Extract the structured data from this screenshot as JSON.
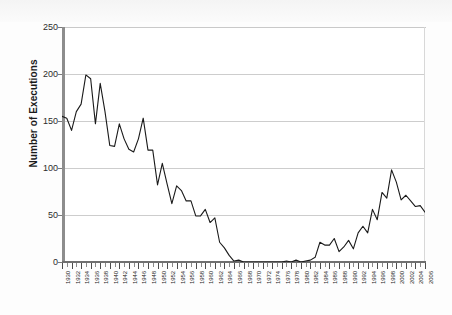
{
  "chart_data": {
    "type": "line",
    "title": "",
    "xlabel": "",
    "ylabel": "Number of Executions",
    "xlim": [
      1930,
      2006
    ],
    "ylim": [
      0,
      250
    ],
    "yticks": [
      0,
      50,
      100,
      150,
      200,
      250
    ],
    "xticks": [
      1930,
      1932,
      1934,
      1936,
      1938,
      1940,
      1942,
      1944,
      1946,
      1948,
      1950,
      1952,
      1954,
      1956,
      1958,
      1960,
      1962,
      1964,
      1966,
      1968,
      1970,
      1972,
      1974,
      1976,
      1978,
      1980,
      1982,
      1984,
      1986,
      1988,
      1990,
      1992,
      1994,
      1996,
      1998,
      2000,
      2002,
      2004,
      2006
    ],
    "grid": true,
    "legend": "none",
    "series": [
      {
        "name": "Executions",
        "color": "#1a1a1a",
        "x": [
          1930,
          1931,
          1932,
          1933,
          1934,
          1935,
          1936,
          1937,
          1938,
          1939,
          1940,
          1941,
          1942,
          1943,
          1944,
          1945,
          1946,
          1947,
          1948,
          1949,
          1950,
          1951,
          1952,
          1953,
          1954,
          1955,
          1956,
          1957,
          1958,
          1959,
          1960,
          1961,
          1962,
          1963,
          1964,
          1965,
          1966,
          1967,
          1968,
          1969,
          1970,
          1971,
          1972,
          1973,
          1974,
          1975,
          1976,
          1977,
          1978,
          1979,
          1980,
          1981,
          1982,
          1983,
          1984,
          1985,
          1986,
          1987,
          1988,
          1989,
          1990,
          1991,
          1992,
          1993,
          1994,
          1995,
          1996,
          1997,
          1998,
          1999,
          2000,
          2001,
          2002,
          2003,
          2004,
          2005,
          2006
        ],
        "values": [
          155,
          153,
          140,
          160,
          168,
          199,
          195,
          147,
          190,
          160,
          124,
          123,
          147,
          131,
          120,
          117,
          131,
          153,
          119,
          119,
          82,
          105,
          83,
          62,
          81,
          76,
          65,
          65,
          49,
          49,
          56,
          42,
          47,
          21,
          15,
          7,
          1,
          2,
          0,
          0,
          0,
          0,
          0,
          0,
          0,
          0,
          0,
          1,
          0,
          2,
          0,
          1,
          2,
          5,
          21,
          18,
          18,
          25,
          11,
          16,
          23,
          14,
          31,
          38,
          31,
          56,
          45,
          74,
          68,
          98,
          85,
          66,
          71,
          65,
          59,
          60,
          53
        ]
      }
    ]
  },
  "axis": {
    "y_title": "Number of Executions",
    "y_tick_labels": [
      "0",
      "50",
      "100",
      "150",
      "200",
      "250"
    ],
    "x_tick_labels": [
      "1930",
      "1932",
      "1934",
      "1936",
      "1938",
      "1940",
      "1942",
      "1944",
      "1946",
      "1948",
      "1950",
      "1952",
      "1954",
      "1956",
      "1958",
      "1960",
      "1962",
      "1964",
      "1966",
      "1968",
      "1970",
      "1972",
      "1974",
      "1976",
      "1978",
      "1980",
      "1982",
      "1984",
      "1986",
      "1988",
      "1990",
      "1992",
      "1994",
      "1996",
      "1998",
      "2000",
      "2002",
      "2004",
      "2006"
    ]
  },
  "colors": {
    "line": "#1a1a1a",
    "grid": "#cdcdcd",
    "axis": "#6f6f6f",
    "text": "#1a1a1a",
    "plot_background": "#ffffff",
    "page_background": "#fdfdfd"
  }
}
